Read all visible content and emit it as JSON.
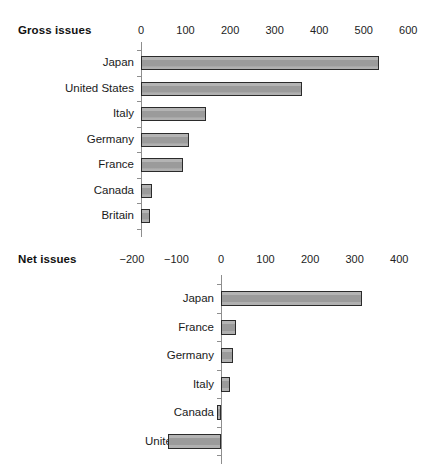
{
  "chart_data": [
    {
      "type": "bar",
      "orientation": "horizontal",
      "title": "Gross issues",
      "xlabel": "",
      "ylabel": "",
      "categories": [
        "Japan",
        "United States",
        "Italy",
        "Germany",
        "France",
        "Canada",
        "Britain"
      ],
      "values": [
        534,
        362,
        147,
        107,
        95,
        25,
        20
      ],
      "xlim": [
        0,
        600
      ],
      "xticks": [
        0,
        100,
        200,
        300,
        400,
        500,
        600
      ],
      "xtick_labels": [
        "0",
        "100",
        "200",
        "300",
        "400",
        "500",
        "600"
      ],
      "grid": false,
      "legend": "none",
      "bar_fill": "#a3a3a3",
      "bar_edge": "#2b2b2b",
      "axis_color": "#8e8e8e"
    },
    {
      "type": "bar",
      "orientation": "horizontal",
      "title": "Net issues",
      "xlabel": "",
      "ylabel": "",
      "categories": [
        "Japan",
        "France",
        "Germany",
        "Italy",
        "Canada",
        "United States"
      ],
      "values": [
        316,
        33,
        27,
        20,
        -8,
        -120
      ],
      "xlim": [
        -200,
        400
      ],
      "xticks": [
        -200,
        -100,
        0,
        100,
        200,
        300,
        400
      ],
      "xtick_labels": [
        "−200",
        "−100",
        "0",
        "100",
        "200",
        "300",
        "400"
      ],
      "grid": false,
      "legend": "none",
      "bar_fill": "#a3a3a3",
      "bar_edge": "#2b2b2b",
      "axis_color": "#8e8e8e"
    }
  ],
  "gross": {
    "title": "Gross issues",
    "ticks": [
      {
        "label": "0",
        "value": 0
      },
      {
        "label": "100",
        "value": 100
      },
      {
        "label": "200",
        "value": 200
      },
      {
        "label": "300",
        "value": 300
      },
      {
        "label": "400",
        "value": 400
      },
      {
        "label": "500",
        "value": 500
      },
      {
        "label": "600",
        "value": 600
      }
    ],
    "rows": [
      {
        "label": "Japan",
        "value": 534
      },
      {
        "label": "United States",
        "value": 362
      },
      {
        "label": "Italy",
        "value": 147
      },
      {
        "label": "Germany",
        "value": 107
      },
      {
        "label": "France",
        "value": 95
      },
      {
        "label": "Canada",
        "value": 25
      },
      {
        "label": "Britain",
        "value": 20
      }
    ]
  },
  "net": {
    "title": "Net issues",
    "ticks": [
      {
        "label": "−200",
        "value": -200
      },
      {
        "label": "−100",
        "value": -100
      },
      {
        "label": "0",
        "value": 0
      },
      {
        "label": "100",
        "value": 100
      },
      {
        "label": "200",
        "value": 200
      },
      {
        "label": "300",
        "value": 300
      },
      {
        "label": "400",
        "value": 400
      }
    ],
    "rows": [
      {
        "label": "Japan",
        "value": 316
      },
      {
        "label": "France",
        "value": 33
      },
      {
        "label": "Germany",
        "value": 27
      },
      {
        "label": "Italy",
        "value": 20
      },
      {
        "label": "Canada",
        "value": -8
      },
      {
        "label": "United States",
        "value": -120
      }
    ]
  }
}
